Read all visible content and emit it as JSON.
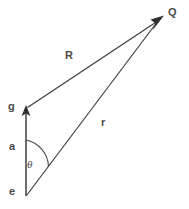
{
  "figure": {
    "type": "vector-diagram",
    "background_color": "#ffffff",
    "stroke_color": "#3a3a3a",
    "label_color": "#4a4a4a",
    "width": 189,
    "height": 209
  },
  "points": {
    "e": {
      "label": "e",
      "x": 26,
      "y": 196,
      "label_x": 9,
      "label_y": 195
    },
    "g": {
      "label": "g",
      "x": 26,
      "y": 107,
      "label_x": 8,
      "label_y": 110
    },
    "Q": {
      "label": "Q",
      "x": 163,
      "y": 17,
      "label_x": 168,
      "label_y": 16
    }
  },
  "vectors": [
    {
      "name": "a",
      "label": "a",
      "from": "e",
      "to": "g",
      "arrow": true,
      "label_x": 9,
      "label_y": 150
    },
    {
      "name": "R",
      "label": "R",
      "from": "g",
      "to": "Q",
      "arrow": true,
      "label_x": 65,
      "label_y": 59
    },
    {
      "name": "r",
      "label": "r",
      "from": "e",
      "to": "Q",
      "arrow": true,
      "label_x": 101,
      "label_y": 126
    }
  ],
  "angle": {
    "name": "theta",
    "label": "θ",
    "vertex": "e",
    "between": [
      "a",
      "r"
    ],
    "label_x": 27,
    "label_y": 168
  }
}
